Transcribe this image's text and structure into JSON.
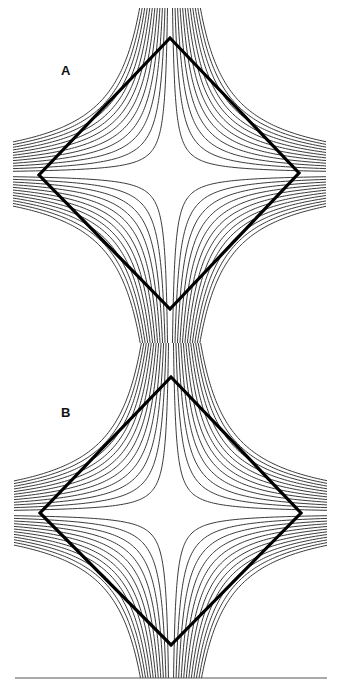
{
  "figure": {
    "width": 337,
    "height": 690,
    "stream_color": "#3a3a3a",
    "diamond_color": "#000000",
    "baseline": {
      "x1": 15,
      "x2": 327,
      "y": 678
    }
  },
  "panels": [
    {
      "label": "A",
      "label_pos": {
        "x": 61,
        "y": 64
      },
      "center": {
        "x": 170,
        "y": 174
      },
      "bounds": {
        "left": 13,
        "right": 326,
        "top": 8,
        "bottom": 343
      },
      "diamond": [
        [
          170,
          38
        ],
        [
          299,
          173
        ],
        [
          170,
          309
        ],
        [
          39,
          175
        ]
      ]
    },
    {
      "label": "B",
      "label_pos": {
        "x": 61,
        "y": 406
      },
      "center": {
        "x": 171,
        "y": 513
      },
      "bounds": {
        "left": 14,
        "right": 327,
        "top": 343,
        "bottom": 678
      },
      "diamond": [
        [
          171,
          377
        ],
        [
          301,
          513
        ],
        [
          171,
          645
        ],
        [
          40,
          513
        ]
      ]
    }
  ],
  "streamlines": {
    "per_quadrant": 12,
    "constant_step": 420,
    "constant_start": 420
  }
}
